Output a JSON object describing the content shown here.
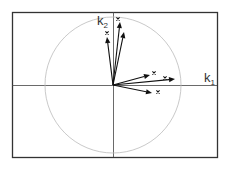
{
  "diagram": {
    "type": "vector-diagram",
    "axes": {
      "x_label": "k",
      "x_sub": "1",
      "y_label": "k",
      "y_sub": "2"
    },
    "frame": {
      "x": 12,
      "y": 12,
      "w": 205,
      "h": 145,
      "color": "#333333"
    },
    "origin": {
      "x": 113,
      "y": 85
    },
    "circle": {
      "r": 68,
      "color": "#bbbbbb"
    },
    "arrow_color": "#111111",
    "vectors": [
      {
        "end": [
          107,
          37
        ],
        "marker": [
          107,
          33
        ]
      },
      {
        "end": [
          120,
          22
        ],
        "marker": [
          118,
          19
        ]
      },
      {
        "end": [
          124,
          32
        ],
        "marker": null
      },
      {
        "end": [
          150,
          75
        ],
        "marker": [
          154,
          73
        ]
      },
      {
        "end": [
          175,
          79
        ],
        "marker": [
          165,
          78
        ]
      },
      {
        "end": [
          152,
          93
        ],
        "marker": [
          158,
          92
        ]
      }
    ]
  }
}
